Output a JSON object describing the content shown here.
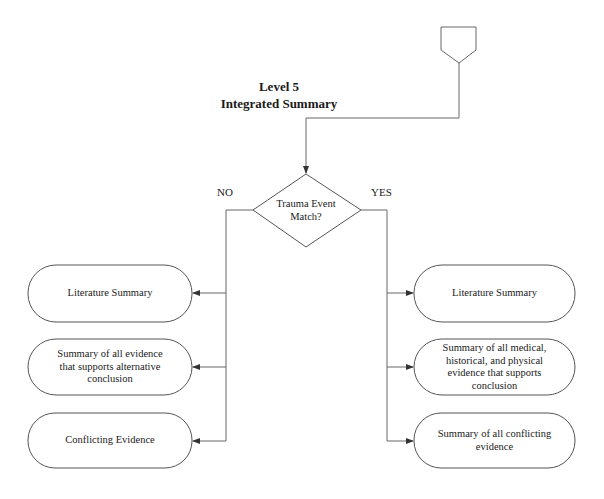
{
  "diagram": {
    "title_line1": "Level 5",
    "title_line2": "Integrated Summary",
    "decision": {
      "line1": "Trauma Event",
      "line2": "Match?"
    },
    "branches": {
      "no_label": "NO",
      "yes_label": "YES"
    },
    "left_nodes": [
      {
        "text": "Literature Summary"
      },
      {
        "text": "Summary of all evidence that supports alternative conclusion"
      },
      {
        "text": "Conflicting Evidence"
      }
    ],
    "right_nodes": [
      {
        "text": "Literature Summary"
      },
      {
        "text": "Summary of all medical, historical, and physical evidence that supports conclusion"
      },
      {
        "text": "Summary of all conflicting evidence"
      }
    ],
    "colors": {
      "stroke": "#555555",
      "background": "#ffffff"
    }
  }
}
